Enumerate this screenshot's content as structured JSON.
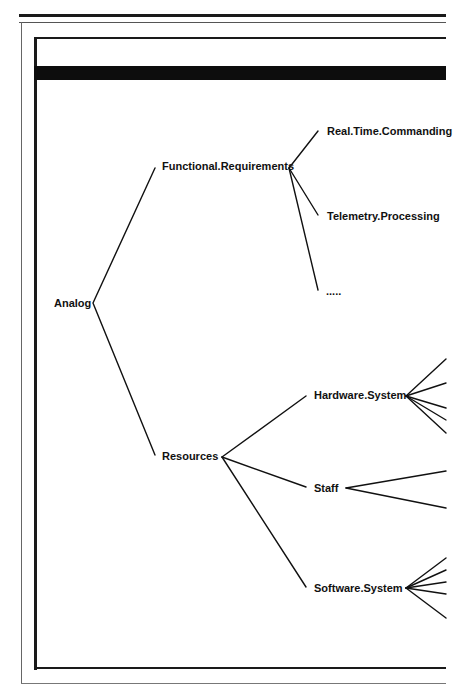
{
  "diagram": {
    "root": "Analog",
    "nodes": {
      "functional": "Functional.Requirements",
      "resources": "Resources",
      "realtime": "Real.Time.Commanding",
      "telemetry": "Telemetry.Processing",
      "ellipsis": ".....",
      "hardware": "Hardware.System",
      "staff": "Staff",
      "software": "Software.System"
    },
    "colors": {
      "ink": "#111111",
      "frame": "#1a1a1a",
      "background": "#ffffff"
    }
  }
}
